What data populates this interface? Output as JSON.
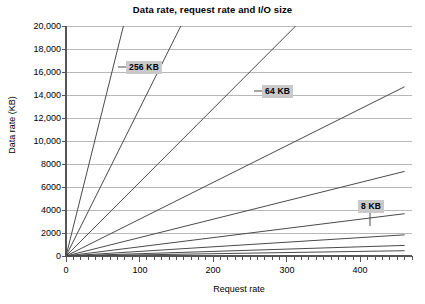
{
  "chart_data": {
    "type": "line",
    "title": "Data rate, request rate and I/O size",
    "xlabel": "Request rate",
    "ylabel": "Data rate (KB)",
    "xlim": [
      0,
      470
    ],
    "ylim": [
      0,
      20000
    ],
    "grid": true,
    "legend_position": "inline-annotations",
    "x_ticks_major": [
      0,
      100,
      200,
      300,
      400
    ],
    "x_tick_labels": [
      "0",
      "100",
      "200",
      "300",
      "400"
    ],
    "x_tick_minor_step": 10,
    "y_ticks": [
      0,
      2000,
      4000,
      6000,
      8000,
      10000,
      12000,
      14000,
      16000,
      18000,
      20000
    ],
    "y_tick_labels": [
      "0",
      "2000",
      "4000",
      "6000",
      "8000",
      "10,000",
      "12,000",
      "14,000",
      "16,000",
      "18,000",
      "20,000"
    ],
    "series": [
      {
        "name": "256 KB",
        "slope": 256,
        "x": [
          0,
          78
        ],
        "values": [
          0,
          20000
        ],
        "labeled": true,
        "annotation": "256 KB"
      },
      {
        "name": "128 KB",
        "slope": 128,
        "x": [
          0,
          156
        ],
        "values": [
          0,
          20000
        ],
        "labeled": false,
        "annotation": ""
      },
      {
        "name": "64 KB",
        "slope": 64,
        "x": [
          0,
          312
        ],
        "values": [
          0,
          20000
        ],
        "labeled": true,
        "annotation": "64 KB"
      },
      {
        "name": "32 KB",
        "slope": 32,
        "x": [
          0,
          460
        ],
        "values": [
          0,
          14720
        ],
        "labeled": false,
        "annotation": ""
      },
      {
        "name": "16 KB",
        "slope": 16,
        "x": [
          0,
          460
        ],
        "values": [
          0,
          7360
        ],
        "labeled": false,
        "annotation": ""
      },
      {
        "name": "8 KB",
        "slope": 8,
        "x": [
          0,
          460
        ],
        "values": [
          0,
          3680
        ],
        "labeled": true,
        "annotation": "8 KB"
      },
      {
        "name": "4 KB",
        "slope": 4,
        "x": [
          0,
          460
        ],
        "values": [
          0,
          1840
        ],
        "labeled": false,
        "annotation": ""
      },
      {
        "name": "2 KB",
        "slope": 2,
        "x": [
          0,
          460
        ],
        "values": [
          0,
          920
        ],
        "labeled": false,
        "annotation": ""
      },
      {
        "name": "1 KB",
        "slope": 1,
        "x": [
          0,
          460
        ],
        "values": [
          0,
          460
        ],
        "labeled": false,
        "annotation": ""
      }
    ],
    "annotations": [
      {
        "text": "256 KB",
        "x": 120,
        "y": 17000
      },
      {
        "text": "64 KB",
        "x": 270,
        "y": 15100
      },
      {
        "text": "8 KB",
        "x": 400,
        "y": 5100
      }
    ]
  },
  "colors": {
    "line": "#4a4a4a",
    "grid": "#b8b8b8",
    "axis": "#555555",
    "annotation_bg": "#c9c9c9",
    "text": "#000000"
  }
}
